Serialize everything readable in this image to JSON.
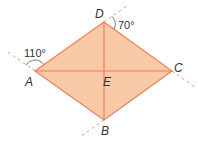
{
  "diagram": {
    "type": "rhombus-with-diagonals",
    "points": {
      "A": {
        "label": "A",
        "x": 35,
        "y": 71
      },
      "B": {
        "label": "B",
        "x": 104,
        "y": 120
      },
      "C": {
        "label": "C",
        "x": 172,
        "y": 71
      },
      "D": {
        "label": "D",
        "x": 104,
        "y": 22
      },
      "E": {
        "label": "E",
        "x": 104,
        "y": 71
      }
    },
    "angles": [
      {
        "at": "A",
        "value": "110°"
      },
      {
        "at": "D",
        "value": "70°"
      }
    ],
    "colors": {
      "fill": "#f9c9a8",
      "stroke": "#e8825a",
      "dashed": "#e89a85",
      "arc": "#555555",
      "text": "#333333"
    }
  }
}
